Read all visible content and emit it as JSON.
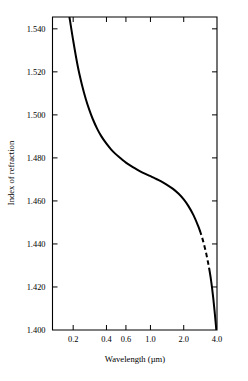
{
  "chart_data": {
    "type": "line",
    "title": "",
    "xlabel": "Wavelength (µm)",
    "ylabel": "Index of refraction",
    "x_scale": "log",
    "y_scale": "linear",
    "xlim": [
      0.13,
      4.0
    ],
    "ylim": [
      1.4,
      1.5455
    ],
    "grid": false,
    "legend": null,
    "x_tick_labels": [
      "0.2",
      "0.4",
      "0.6",
      "1.0",
      "2.0",
      "4.0"
    ],
    "x_tick_values": [
      0.2,
      0.4,
      0.6,
      1.0,
      2.0,
      4.0
    ],
    "y_tick_labels": [
      "1.400",
      "1.420",
      "1.440",
      "1.460",
      "1.480",
      "1.500",
      "1.520",
      "1.540"
    ],
    "y_tick_values": [
      1.4,
      1.42,
      1.44,
      1.46,
      1.48,
      1.5,
      1.52,
      1.54
    ],
    "series": [
      {
        "name": "Index of refraction",
        "style": "solid",
        "x": [
          0.185,
          0.2,
          0.22,
          0.24,
          0.26,
          0.28,
          0.3,
          0.33,
          0.36,
          0.4,
          0.44,
          0.48,
          0.52,
          0.56,
          0.6,
          0.66,
          0.72,
          0.8,
          0.9,
          1.0,
          1.1,
          1.25,
          1.4,
          1.6,
          1.8,
          2.0,
          2.2,
          2.45,
          2.7,
          2.8
        ],
        "y": [
          1.5455,
          1.5346,
          1.5226,
          1.514,
          1.5074,
          1.5023,
          1.4982,
          1.4935,
          1.49,
          1.4866,
          1.484,
          1.482,
          1.4804,
          1.479,
          1.4778,
          1.4764,
          1.4752,
          1.4739,
          1.4726,
          1.4715,
          1.4705,
          1.4691,
          1.4676,
          1.4656,
          1.4633,
          1.4607,
          1.4577,
          1.4534,
          1.4484,
          1.4462
        ]
      },
      {
        "name": "Index of refraction (extrapolated)",
        "style": "dashed",
        "x": [
          2.8,
          2.9,
          3.0,
          3.1,
          3.2,
          3.3,
          3.4
        ],
        "y": [
          1.4462,
          1.4438,
          1.4412,
          1.4384,
          1.4354,
          1.4321,
          1.4286
        ]
      },
      {
        "name": "Index of refraction (upper tail)",
        "style": "solid",
        "x": [
          3.4,
          3.5,
          3.6,
          3.7,
          3.8,
          3.9,
          4.0
        ],
        "y": [
          1.4286,
          1.4246,
          1.42,
          1.4148,
          1.409,
          1.4028,
          1.396
        ]
      }
    ]
  }
}
